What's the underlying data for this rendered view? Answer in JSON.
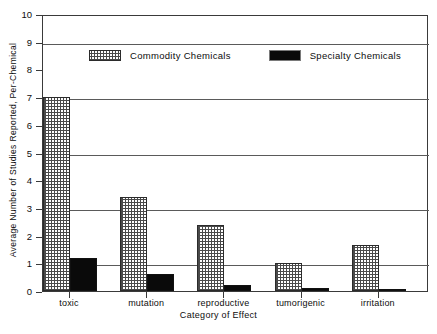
{
  "chart_data": {
    "type": "bar",
    "title": "",
    "xlabel": "Category of Effect",
    "ylabel": "Average Number of Studies Reported, Per-Chemical",
    "categories": [
      "toxic",
      "mutation",
      "reproductive",
      "tumorigenic",
      "irritation"
    ],
    "series": [
      {
        "name": "Commodity Chemicals",
        "values": [
          7.0,
          3.4,
          2.4,
          1.0,
          1.65
        ],
        "color": "#4a4a4a",
        "pattern": "stipple"
      },
      {
        "name": "Specialty Chemicals",
        "values": [
          1.2,
          0.6,
          0.2,
          0.1,
          0.07
        ],
        "color": "#0a0a0a",
        "pattern": "solid"
      }
    ],
    "ylim": [
      0,
      10
    ],
    "ytick_labels": [
      "0",
      "1",
      "2",
      "3",
      "4",
      "5",
      "6",
      "7",
      "8",
      "9",
      "10"
    ],
    "ytick_values": [
      0,
      1,
      2,
      3,
      4,
      5,
      6,
      7,
      8,
      9,
      10
    ],
    "gridline_values": [
      1,
      3,
      5,
      7,
      9
    ],
    "grid": true,
    "legend_position": "upper center"
  },
  "legend": {
    "entries": [
      {
        "label": "Commodity Chemicals"
      },
      {
        "label": "Specialty Chemicals"
      }
    ]
  }
}
